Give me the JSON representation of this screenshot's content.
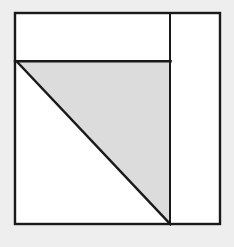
{
  "canvas": {
    "width": 234,
    "height": 247,
    "background_color": "#eeeeee",
    "title": "Geometric figure: right triangle inside bordered rectangle"
  },
  "style": {
    "stroke_color": "#1a1a1a",
    "stroke_width": 2.4,
    "divider_stroke_width": 2.0,
    "triangle_fill": "#dcdcdc",
    "band_fill": "#ffffff",
    "column_fill": "#ffffff",
    "outer_fill": "#ffffff"
  },
  "geometry": {
    "outer_rect": {
      "label": "outer-rectangle",
      "x": 15,
      "y": 13,
      "width": 205,
      "height": 211,
      "left": 15,
      "top": 13,
      "right": 220,
      "bottom": 224
    },
    "divider_x": 170,
    "band_bottom_y": 61,
    "band": {
      "label": "top-white-band",
      "points": "15,13 170,13 170,61 15,61"
    },
    "right_column": {
      "label": "right-white-column",
      "points": "170,13 220,13 220,224 170,224"
    },
    "triangle": {
      "label": "gray-right-triangle",
      "points": "17,62 170,62 170,224",
      "vertices": [
        {
          "name": "apex-top-left",
          "x": 17,
          "y": 62
        },
        {
          "name": "corner-top-right",
          "x": 170,
          "y": 62
        },
        {
          "name": "corner-bottom-right",
          "x": 170,
          "y": 224
        }
      ],
      "legs": {
        "horizontal": 153,
        "vertical": 162
      },
      "hypotenuse_from": {
        "x": 17,
        "y": 62
      },
      "hypotenuse_to": {
        "x": 170,
        "y": 224
      }
    },
    "lines": [
      {
        "name": "outer-border",
        "type": "rect"
      },
      {
        "name": "band-bottom-line",
        "x1": 15,
        "y1": 61,
        "x2": 170,
        "y2": 61
      },
      {
        "name": "vertical-divider-line",
        "x1": 170,
        "y1": 13,
        "x2": 170,
        "y2": 224
      },
      {
        "name": "diagonal-hypotenuse-line",
        "x1": 17,
        "y1": 62,
        "x2": 170,
        "y2": 224
      }
    ]
  },
  "labels": {
    "figure_caption": "",
    "annotations": []
  }
}
